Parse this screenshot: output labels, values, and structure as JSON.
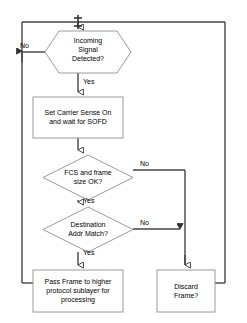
{
  "diagram": {
    "type": "flowchart",
    "colors": {
      "node_stroke": "#999999",
      "node_fill": "#ffffff",
      "connector": "#333333",
      "text": "#000000",
      "background": "#ffffff"
    },
    "nodes": [
      {
        "id": "junction",
        "shape": "junction-point",
        "label": "",
        "x": 78,
        "y": 22
      },
      {
        "id": "incoming-signal",
        "shape": "hexagon",
        "label": "Incoming\nSignal\nDetected?",
        "x": 45,
        "y": 31,
        "w": 86,
        "h": 42
      },
      {
        "id": "set-carrier-sense",
        "shape": "rectangle",
        "label": "Set Carrier Sense On\nand wait for SOFD",
        "x": 33,
        "y": 97,
        "w": 90,
        "h": 41
      },
      {
        "id": "fcs-frame-size",
        "shape": "diamond",
        "label": "FCS and frame\nsize OK?",
        "x": 43,
        "y": 155,
        "w": 90,
        "h": 45
      },
      {
        "id": "destination-addr",
        "shape": "diamond",
        "label": "Destination\nAddr Match?",
        "x": 43,
        "y": 207,
        "w": 90,
        "h": 45
      },
      {
        "id": "pass-frame",
        "shape": "rectangle",
        "label": "Pass Frame to higher\nprotocol sublayer for\nprocessing",
        "x": 33,
        "y": 270,
        "w": 90,
        "h": 42
      },
      {
        "id": "discard-frame",
        "shape": "rectangle",
        "label": "Discard\nFrame?",
        "x": 157,
        "y": 270,
        "w": 58,
        "h": 42
      }
    ],
    "edge_labels": [
      {
        "id": "no-incoming-signal",
        "text": "No",
        "x": 20,
        "y": 42
      },
      {
        "id": "yes-incoming-signal",
        "text": "Yes",
        "x": 83,
        "y": 79
      },
      {
        "id": "no-fcs",
        "text": "No",
        "x": 138,
        "y": 161
      },
      {
        "id": "yes-fcs",
        "text": "Yes",
        "x": 83,
        "y": 196
      },
      {
        "id": "no-destination",
        "text": "No",
        "x": 138,
        "y": 213
      },
      {
        "id": "yes-destination",
        "text": "Yes",
        "x": 83,
        "y": 248
      }
    ],
    "edges": [
      {
        "id": "junction-to-incoming-signal",
        "from": "junction",
        "to": "incoming-signal",
        "label": ""
      },
      {
        "id": "incoming-signal-no-to-left-rail",
        "from": "incoming-signal",
        "to": "left-rail",
        "label": "No"
      },
      {
        "id": "incoming-signal-yes-to-set-carrier-sense",
        "from": "incoming-signal",
        "to": "set-carrier-sense",
        "label": "Yes"
      },
      {
        "id": "set-carrier-sense-to-fcs",
        "from": "set-carrier-sense",
        "to": "fcs-frame-size",
        "label": ""
      },
      {
        "id": "fcs-no-to-discard-rail",
        "from": "fcs-frame-size",
        "to": "discard-frame",
        "label": "No"
      },
      {
        "id": "fcs-yes-to-destination",
        "from": "fcs-frame-size",
        "to": "destination-addr",
        "label": "Yes"
      },
      {
        "id": "destination-no-to-discard-rail",
        "from": "destination-addr",
        "to": "discard-frame",
        "label": "No"
      },
      {
        "id": "destination-yes-to-pass-frame",
        "from": "destination-addr",
        "to": "pass-frame",
        "label": "Yes"
      },
      {
        "id": "pass-frame-to-left-rail",
        "from": "pass-frame",
        "to": "left-rail",
        "label": ""
      },
      {
        "id": "discard-frame-to-right-rail",
        "from": "discard-frame",
        "to": "junction",
        "label": ""
      }
    ]
  }
}
